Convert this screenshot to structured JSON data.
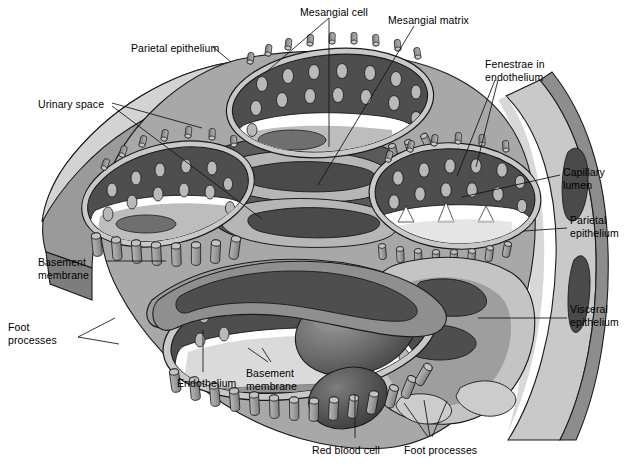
{
  "figure": {
    "background_color": "#ffffff",
    "palette": {
      "outline": "#1a1a1a",
      "urinary_space_white": "#ffffff",
      "light_gray": "#c9c9c9",
      "pale_gray": "#d8d8d8",
      "mid_gray": "#9a9a9a",
      "mid_dark_gray": "#7d7d7d",
      "dark_gray": "#585858",
      "darker_gray": "#464646",
      "rbc_gray": "#6a6a6a"
    }
  },
  "labels": [
    {
      "id": "mesangial-cell",
      "text": "Mesangial cell",
      "x": 300,
      "y": 6,
      "align": "left"
    },
    {
      "id": "mesangial-matrix",
      "text": "Mesangial matrix",
      "x": 388,
      "y": 14,
      "align": "left"
    },
    {
      "id": "parietal-epithelium-top",
      "text": "Parietal epithelium",
      "x": 131,
      "y": 42,
      "align": "left"
    },
    {
      "id": "fenestrae-endothelium",
      "text": "Fenestrae in\nendothelium",
      "x": 485,
      "y": 58,
      "align": "left"
    },
    {
      "id": "urinary-space",
      "text": "Urinary space",
      "x": 38,
      "y": 98,
      "align": "left"
    },
    {
      "id": "capillary-lumen",
      "text": "Capillary\nlumen",
      "x": 563,
      "y": 166,
      "align": "left"
    },
    {
      "id": "parietal-epithelium-right",
      "text": "Parietal\nepithelium",
      "x": 570,
      "y": 214,
      "align": "left"
    },
    {
      "id": "basement-membrane-left",
      "text": "Basement\nmembrane",
      "x": 38,
      "y": 256,
      "align": "left"
    },
    {
      "id": "visceral-epithelium",
      "text": "Visceral\nepithelium",
      "x": 570,
      "y": 303,
      "align": "left"
    },
    {
      "id": "foot-processes-left",
      "text": "Foot\nprocesses",
      "x": 8,
      "y": 321,
      "align": "left"
    },
    {
      "id": "endothelium",
      "text": "Endothelium",
      "x": 177,
      "y": 377,
      "align": "left"
    },
    {
      "id": "basement-membrane-bottom",
      "text": "Basement\nmembrane",
      "x": 246,
      "y": 367,
      "align": "left"
    },
    {
      "id": "red-blood-cell",
      "text": "Red blood cell",
      "x": 312,
      "y": 444,
      "align": "left"
    },
    {
      "id": "foot-processes-bottom",
      "text": "Foot processes",
      "x": 404,
      "y": 444,
      "align": "left"
    }
  ],
  "leader_lines": [
    {
      "id": "leader-mesangial-cell",
      "points": "329,18 329,147"
    },
    {
      "id": "leader-mesangial-cell-b",
      "points": "329,18 265,73"
    },
    {
      "id": "leader-mesangial-matrix",
      "points": "414,26 318,185"
    },
    {
      "id": "leader-parietal-epi-top",
      "points": "213,47 231,62"
    },
    {
      "id": "leader-fenestrae-a",
      "points": "495,80 457,176"
    },
    {
      "id": "leader-fenestrae-b",
      "points": "498,80 476,167"
    },
    {
      "id": "leader-urinary-space-a",
      "points": "112,103 202,128"
    },
    {
      "id": "leader-urinary-space-b",
      "points": "112,106 262,219"
    },
    {
      "id": "leader-capillary-lumen",
      "points": "560,175 462,197"
    },
    {
      "id": "leader-parietal-epi-right",
      "points": "567,228 524,231"
    },
    {
      "id": "leader-basement-membrane-left",
      "points": "106,261 166,261"
    },
    {
      "id": "leader-visceral-epithelium",
      "points": "567,318 478,318"
    },
    {
      "id": "leader-foot-left-a",
      "points": "78,337 115,318"
    },
    {
      "id": "leader-foot-left-b",
      "points": "78,337 119,344"
    },
    {
      "id": "leader-endothelium",
      "points": "203,372 203,330"
    },
    {
      "id": "leader-basement-bottom-a",
      "points": "268,362 248,348"
    },
    {
      "id": "leader-basement-bottom-b",
      "points": "271,362 262,348"
    },
    {
      "id": "leader-rbc",
      "points": "355,438 355,395"
    },
    {
      "id": "leader-foot-bottom-a",
      "points": "428,437 404,403"
    },
    {
      "id": "leader-foot-bottom-b",
      "points": "432,437 447,401"
    },
    {
      "id": "leader-foot-bottom-c",
      "points": "430,437 424,400"
    }
  ]
}
